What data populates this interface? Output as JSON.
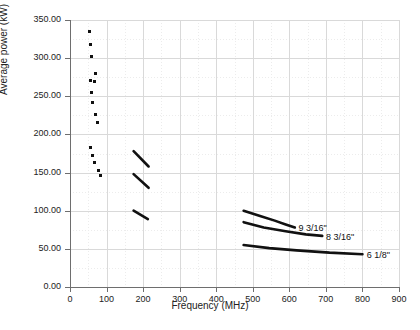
{
  "chart_data": {
    "type": "scatter",
    "title": "",
    "subtitle": "",
    "xlabel": "Frequency (MHz)",
    "ylabel": "Average power (kW)",
    "xlim": [
      0,
      900
    ],
    "ylim": [
      0,
      350
    ],
    "xticks": [
      0,
      100,
      200,
      300,
      400,
      500,
      600,
      700,
      800,
      900
    ],
    "xtick_labels": [
      "0",
      "100",
      "200",
      "300",
      "400",
      "500",
      "600",
      "700",
      "800",
      "900"
    ],
    "yticks": [
      0,
      50,
      100,
      150,
      200,
      250,
      300,
      350
    ],
    "ytick_labels": [
      "0.00",
      "50.00",
      "100.00",
      "150.00",
      "200.00",
      "250.00",
      "300.00",
      "350.00"
    ],
    "grid": true,
    "minor_grid": true,
    "legend": "none",
    "annotations": [
      {
        "text": "9 3/16\"",
        "x": 625,
        "y": 77
      },
      {
        "text": "8 3/16\"",
        "x": 700,
        "y": 66
      },
      {
        "text": "6 1/8\"",
        "x": 812,
        "y": 42
      }
    ],
    "series": [
      {
        "name": "scatter-points",
        "type": "scatter",
        "marker": "square",
        "color": "#111111",
        "points": [
          {
            "x": 54,
            "y": 335
          },
          {
            "x": 57,
            "y": 318
          },
          {
            "x": 60,
            "y": 302
          },
          {
            "x": 70,
            "y": 280
          },
          {
            "x": 55,
            "y": 271
          },
          {
            "x": 68,
            "y": 269
          },
          {
            "x": 58,
            "y": 255
          },
          {
            "x": 61,
            "y": 242
          },
          {
            "x": 70,
            "y": 226
          },
          {
            "x": 75,
            "y": 216
          },
          {
            "x": 56,
            "y": 183
          },
          {
            "x": 62,
            "y": 172
          },
          {
            "x": 67,
            "y": 163
          },
          {
            "x": 78,
            "y": 153
          },
          {
            "x": 84,
            "y": 146
          }
        ]
      },
      {
        "name": "vhf-band-upper",
        "type": "line",
        "color": "#111111",
        "points": [
          {
            "x": 174,
            "y": 178
          },
          {
            "x": 215,
            "y": 158
          }
        ]
      },
      {
        "name": "vhf-band-middle",
        "type": "line",
        "color": "#111111",
        "points": [
          {
            "x": 174,
            "y": 148
          },
          {
            "x": 215,
            "y": 130
          }
        ]
      },
      {
        "name": "vhf-band-lower",
        "type": "line",
        "color": "#111111",
        "points": [
          {
            "x": 174,
            "y": 100
          },
          {
            "x": 213,
            "y": 89
          }
        ]
      },
      {
        "name": "9 3/16\"",
        "type": "line",
        "color": "#111111",
        "points": [
          {
            "x": 475,
            "y": 100
          },
          {
            "x": 520,
            "y": 93
          },
          {
            "x": 560,
            "y": 87
          },
          {
            "x": 590,
            "y": 82
          },
          {
            "x": 615,
            "y": 78
          }
        ]
      },
      {
        "name": "8 3/16\"",
        "type": "line",
        "color": "#111111",
        "points": [
          {
            "x": 475,
            "y": 85
          },
          {
            "x": 530,
            "y": 78
          },
          {
            "x": 590,
            "y": 73
          },
          {
            "x": 645,
            "y": 69
          },
          {
            "x": 690,
            "y": 67
          }
        ]
      },
      {
        "name": "6 1/8\"",
        "type": "line",
        "color": "#111111",
        "points": [
          {
            "x": 475,
            "y": 55
          },
          {
            "x": 545,
            "y": 51
          },
          {
            "x": 620,
            "y": 48
          },
          {
            "x": 710,
            "y": 45
          },
          {
            "x": 800,
            "y": 43
          }
        ]
      }
    ]
  }
}
